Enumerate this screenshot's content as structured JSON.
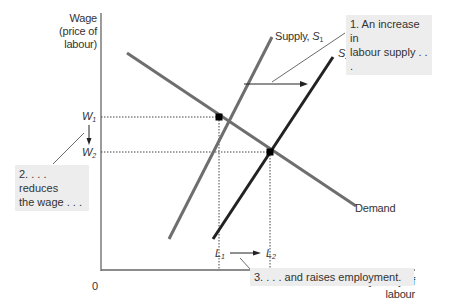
{
  "diagram": {
    "y_axis": {
      "label_line1": "Wage",
      "label_line2": "(price of",
      "label_line3": "labour)"
    },
    "x_axis": {
      "label_line1": "Quantity of",
      "label_line2": "labour"
    },
    "origin": "0",
    "curves": {
      "supply1": {
        "label": "Supply, ",
        "symbol": "S",
        "sub": "1"
      },
      "supply2": {
        "symbol": "S",
        "sub": "2"
      },
      "demand": {
        "label": "Demand"
      }
    },
    "ticks": {
      "w1": {
        "symbol": "W",
        "sub": "1"
      },
      "w2": {
        "symbol": "W",
        "sub": "2"
      },
      "l1": {
        "symbol": "L",
        "sub": "1"
      },
      "l2": {
        "symbol": "L",
        "sub": "2"
      }
    },
    "annotations": {
      "a1_line1": "1. An increase in",
      "a1_line2": "labour supply . . .",
      "a2_line1": "2. . . . reduces",
      "a2_line2": "the wage . . .",
      "a3": "3. . . . and raises employment."
    },
    "colors": {
      "axis": "#666666",
      "supply1": "#6e6e6e",
      "supply2": "#222222",
      "demand": "#6e6e6e",
      "annotation_bg": "#ededed"
    }
  }
}
